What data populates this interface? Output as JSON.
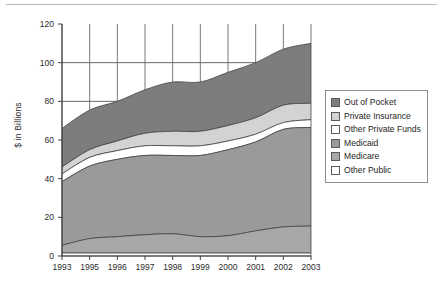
{
  "chart_data": {
    "type": "area",
    "stacked": true,
    "title": "",
    "xlabel": "",
    "ylabel": "$ in Billions",
    "ylim": [
      0,
      120
    ],
    "yticks": [
      0,
      20,
      40,
      60,
      80,
      100,
      120
    ],
    "ytick_labels": [
      "0",
      "20",
      "40",
      "60",
      "80",
      "100",
      "120"
    ],
    "grid": "horizontal gridlines at 80 and 100 only; vertical gridlines at each year above the stack",
    "legend_position": "right",
    "categories": [
      "1993",
      "1995",
      "1996",
      "1997",
      "1998",
      "1999",
      "2000",
      "2001",
      "2002",
      "2003"
    ],
    "series": [
      {
        "name": "Other Public",
        "color": "#ffffff",
        "stack_order": 1,
        "values": [
          1.5,
          1.5,
          1.5,
          1.5,
          1.5,
          1.5,
          1.5,
          1.5,
          1.5,
          1.5
        ]
      },
      {
        "name": "Medicare",
        "color": "#a8a8a8",
        "stack_order": 2,
        "values": [
          4.0,
          7.5,
          8.5,
          9.5,
          10.0,
          8.5,
          9.0,
          11.5,
          13.5,
          14.0
        ]
      },
      {
        "name": "Medicaid",
        "color": "#9a9a9a",
        "stack_order": 3,
        "values": [
          33.0,
          37.5,
          40.0,
          41.0,
          40.5,
          42.0,
          44.5,
          46.0,
          50.5,
          51.0
        ]
      },
      {
        "name": "Other Private Funds",
        "color": "#ffffff",
        "stack_order": 4,
        "values": [
          4.0,
          4.5,
          4.5,
          5.0,
          5.0,
          5.0,
          4.5,
          4.0,
          3.5,
          4.0
        ]
      },
      {
        "name": "Private Insurance",
        "color": "#d3d3d3",
        "stack_order": 5,
        "values": [
          3.5,
          4.0,
          5.0,
          6.5,
          7.5,
          7.5,
          8.0,
          8.5,
          9.0,
          8.5
        ]
      },
      {
        "name": "Out of Pocket",
        "color": "#7d7d7d",
        "stack_order": 6,
        "values": [
          20.0,
          20.5,
          20.5,
          22.5,
          25.5,
          25.5,
          27.5,
          28.5,
          29.0,
          31.0
        ]
      }
    ],
    "totals": [
      66.0,
      75.5,
      80.0,
      86.0,
      90.0,
      90.0,
      95.0,
      100.0,
      107.0,
      110.0
    ]
  },
  "legend": {
    "items": [
      {
        "label": "Out of Pocket",
        "swatch": "#7d7d7d"
      },
      {
        "label": "Private Insurance",
        "swatch": "#d3d3d3"
      },
      {
        "label": "Other Private Funds",
        "swatch": "#ffffff"
      },
      {
        "label": "Medicaid",
        "swatch": "#9a9a9a"
      },
      {
        "label": "Medicare",
        "swatch": "#a8a8a8"
      },
      {
        "label": "Other Public",
        "swatch": "#ffffff"
      }
    ]
  }
}
